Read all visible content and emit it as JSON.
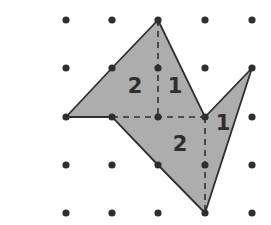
{
  "grid": {
    "cols_x": [
      66,
      112,
      158,
      205,
      252
    ],
    "rows_y": [
      20,
      68,
      117,
      165,
      213
    ],
    "dot_radius": 3.6,
    "dot_color": "#2f2f2f"
  },
  "shape": {
    "vertices": [
      [
        2,
        0
      ],
      [
        3,
        2
      ],
      [
        4,
        1
      ],
      [
        3,
        4
      ],
      [
        2,
        3
      ],
      [
        1,
        2
      ],
      [
        0,
        2
      ],
      [
        1,
        1
      ]
    ],
    "fill": "#adadad",
    "stroke": "#2f2f2f"
  },
  "dashed_lines": [
    {
      "from": [
        2,
        0
      ],
      "to": [
        2,
        2
      ]
    },
    {
      "from": [
        1,
        2
      ],
      "to": [
        3,
        2
      ]
    },
    {
      "from": [
        3,
        2
      ],
      "to": [
        3,
        4
      ]
    }
  ],
  "labels": [
    {
      "text": "2",
      "x": 135,
      "y": 93
    },
    {
      "text": "1",
      "x": 175,
      "y": 93
    },
    {
      "text": "1",
      "x": 223,
      "y": 130
    },
    {
      "text": "2",
      "x": 180,
      "y": 151
    }
  ]
}
